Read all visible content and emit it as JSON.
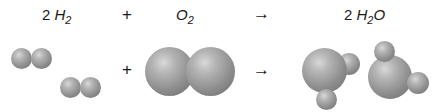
{
  "equation": {
    "reactant1": {
      "coef": "2",
      "element": "H",
      "sub": "2"
    },
    "plus": "+",
    "reactant2": {
      "element": "O",
      "sub": "2"
    },
    "arrow": "→",
    "product": {
      "coef": "2",
      "element": "H",
      "sub": "2",
      "tail": "O"
    }
  },
  "models": {
    "plus": "+",
    "arrow": "→"
  }
}
